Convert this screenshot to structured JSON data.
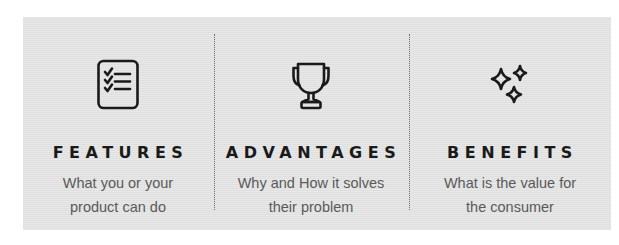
{
  "columns": [
    {
      "icon": "checklist-icon",
      "title": "FEATURES",
      "description_line1": "What you or your",
      "description_line2": "product can do"
    },
    {
      "icon": "trophy-icon",
      "title": "ADVANTAGES",
      "description_line1": "Why and How it solves",
      "description_line2": "their problem"
    },
    {
      "icon": "sparkles-icon",
      "title": "BENEFITS",
      "description_line1": "What is the value for",
      "description_line2": "the consumer"
    }
  ],
  "colors": {
    "panel_background": "#e3e3e3",
    "heading": "#1a1a1a",
    "description": "#5a5a5a",
    "icon_stroke": "#1a1a1a",
    "divider": "#6a6a6a"
  }
}
